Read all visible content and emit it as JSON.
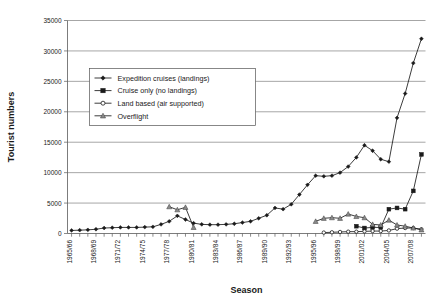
{
  "chart_data": {
    "type": "line",
    "title": "",
    "xlabel": "Season",
    "ylabel": "Tourist numbers",
    "ylim": [
      0,
      35000
    ],
    "ytick_step": 5000,
    "ytick_labels": [
      "0",
      "5000",
      "10000",
      "15000",
      "20000",
      "25000",
      "30000",
      "35000"
    ],
    "grid": true,
    "legend_position": "upper-left-inside",
    "x": [
      "1965/66",
      "1966/67",
      "1967/68",
      "1968/69",
      "1969/70",
      "1970/71",
      "1971/72",
      "1972/73",
      "1973/74",
      "1974/75",
      "1975/76",
      "1976/77",
      "1977/78",
      "1978/79",
      "1979/80",
      "1980/81",
      "1981/82",
      "1982/83",
      "1983/84",
      "1984/85",
      "1985/86",
      "1986/87",
      "1987/88",
      "1988/89",
      "1989/90",
      "1990/91",
      "1991/92",
      "1992/93",
      "1993/94",
      "1994/95",
      "1995/96",
      "1996/97",
      "1997/98",
      "1998/99",
      "1999/00",
      "2000/01",
      "2001/02",
      "2002/03",
      "2003/04",
      "2004/05",
      "2005/06",
      "2006/07",
      "2007/08",
      "2008/09"
    ],
    "xtick_labels_shown": [
      "1965/66",
      "1968/69",
      "1971/72",
      "1974/75",
      "1977/78",
      "1980/81",
      "1983/84",
      "1986/87",
      "1989/90",
      "1992/93",
      "1995/96",
      "1998/99",
      "2001/02",
      "2004/05",
      "2007/08"
    ],
    "xtick_label_step": 3,
    "series": [
      {
        "name": "Expedition cruises (landings)",
        "marker": "filled-diamond",
        "color": "#1a1a1a",
        "values": [
          500,
          550,
          600,
          700,
          900,
          950,
          1000,
          1000,
          1000,
          1050,
          1100,
          1500,
          2000,
          2900,
          2300,
          1700,
          1500,
          1450,
          1450,
          1500,
          1600,
          1800,
          2000,
          2500,
          3000,
          4200,
          4000,
          4800,
          6400,
          8000,
          9500,
          9400,
          9500,
          10000,
          11000,
          12500,
          14500,
          13600,
          12200,
          11800,
          19000,
          23000,
          28000,
          32000
        ]
      },
      {
        "name": "Cruise only (no landings)",
        "marker": "filled-square",
        "color": "#1a1a1a",
        "values": [
          null,
          null,
          null,
          null,
          null,
          null,
          null,
          null,
          null,
          null,
          null,
          null,
          null,
          null,
          null,
          null,
          null,
          null,
          null,
          null,
          null,
          null,
          null,
          null,
          null,
          null,
          null,
          null,
          null,
          null,
          null,
          null,
          null,
          null,
          null,
          1200,
          900,
          1000,
          1000,
          4000,
          4200,
          4000,
          7000,
          13000
        ]
      },
      {
        "name": "Land based (air supported)",
        "marker": "open-circle",
        "color": "#1a1a1a",
        "values": [
          null,
          null,
          null,
          null,
          null,
          null,
          null,
          null,
          null,
          null,
          null,
          null,
          null,
          null,
          null,
          null,
          null,
          null,
          null,
          null,
          null,
          null,
          null,
          null,
          null,
          null,
          null,
          null,
          null,
          null,
          null,
          150,
          200,
          250,
          300,
          300,
          350,
          400,
          400,
          500,
          800,
          900,
          900,
          700
        ]
      },
      {
        "name": "Overflight",
        "marker": "filled-triangle",
        "color": "#8a8a8a",
        "values": [
          null,
          null,
          null,
          null,
          null,
          null,
          null,
          null,
          null,
          null,
          null,
          null,
          4400,
          3900,
          4300,
          1000,
          null,
          null,
          null,
          null,
          null,
          null,
          null,
          null,
          null,
          null,
          null,
          null,
          null,
          null,
          2000,
          2500,
          2600,
          2500,
          3200,
          2800,
          2600,
          1500,
          1400,
          2200,
          1400,
          1200,
          900,
          600
        ]
      }
    ]
  }
}
